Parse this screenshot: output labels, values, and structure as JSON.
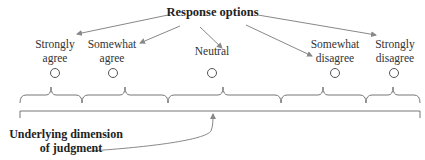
{
  "diagram": {
    "title": "Response options",
    "options": [
      {
        "line1": "Strongly",
        "line2": "agree",
        "x": 55
      },
      {
        "line1": "Somewhat",
        "line2": "agree",
        "x": 112
      },
      {
        "line1": "Neutral",
        "line2": "",
        "x": 212
      },
      {
        "line1": "Somewhat",
        "line2": "disagree",
        "x": 335
      },
      {
        "line1": "Strongly",
        "line2": "disagree",
        "x": 395
      }
    ],
    "dimension_label": {
      "line1": "Underlying dimension",
      "line2": "of judgment"
    },
    "colors": {
      "line": "#888888",
      "text": "#222222"
    }
  }
}
